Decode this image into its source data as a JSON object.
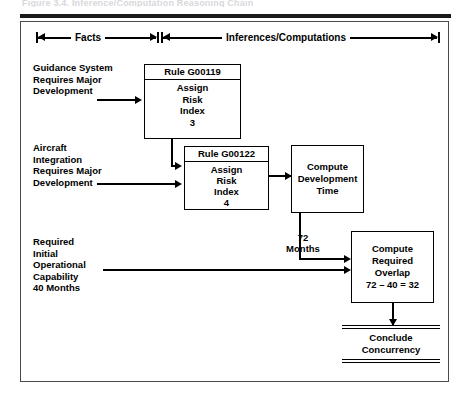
{
  "figure": {
    "caption_top": "Figure 3.4. Inference/Computation Reasoning Chain",
    "header": {
      "left_label": "Facts",
      "right_label": "Inferences/Computations"
    },
    "facts": [
      {
        "id": "fact-guidance-system",
        "text": "Guidance System\nRequires Major\nDevelopment"
      },
      {
        "id": "fact-aircraft-integration",
        "text": "Aircraft\nIntegration\nRequires Major\nDevelopment"
      },
      {
        "id": "fact-required-ioc",
        "text": "Required\nInitial\nOperational\nCapability\n40 Months"
      }
    ],
    "rules": [
      {
        "id": "rule-g00119",
        "header": "Rule G00119",
        "body": "Assign\nRisk\nIndex\n3"
      },
      {
        "id": "rule-g00122",
        "header": "Rule G00122",
        "body": "Assign\nRisk\nIndex\n4"
      }
    ],
    "computations": [
      {
        "id": "compute-development-time",
        "text": "Compute\nDevelopment\nTime"
      },
      {
        "id": "compute-required-overlap",
        "text": "Compute\nRequired\nOverlap\n72 – 40 = 32"
      }
    ],
    "annotations": [
      {
        "id": "annotation-72-months",
        "text": "72\nMonths"
      }
    ],
    "conclusion": {
      "id": "conclude-concurrency",
      "text": "Conclude\nConcurrency"
    },
    "colors": {
      "ink": "#000000",
      "frame": "#4a4a4a",
      "paper": "#ffffff"
    }
  }
}
